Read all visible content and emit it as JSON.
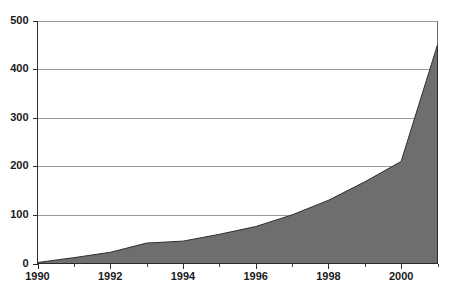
{
  "chart_data": {
    "type": "area",
    "title": "",
    "subtitle": "",
    "xlabel": "",
    "ylabel": "",
    "xlim": [
      1990,
      2001
    ],
    "ylim": [
      0,
      500
    ],
    "grid": true,
    "legend": "none",
    "series_name": "value",
    "fill_color": "#6e6e6e",
    "line_color": "#2e2e2e",
    "grid_color": "#9a9a9a",
    "axis_color": "#2b2b2b",
    "background_color": "#ffffff",
    "x": [
      1990,
      1991,
      1992,
      1993,
      1994,
      1995,
      1996,
      1997,
      1998,
      1999,
      2000,
      2001
    ],
    "values": [
      2,
      12,
      23,
      42,
      46,
      60,
      76,
      100,
      130,
      168,
      210,
      450
    ],
    "y_ticks": [
      0,
      100,
      200,
      300,
      400,
      500
    ],
    "y_tick_labels": [
      "0",
      "100",
      "200",
      "300",
      "400",
      "500"
    ],
    "x_ticks": [
      1990,
      1991,
      1992,
      1993,
      1994,
      1995,
      1996,
      1997,
      1998,
      1999,
      2000,
      2001
    ],
    "x_tick_labels_major": [
      "1990",
      "1992",
      "1994",
      "1996",
      "1998",
      "2000"
    ],
    "x_major_ticks": [
      1990,
      1992,
      1994,
      1996,
      1998,
      2000
    ]
  }
}
